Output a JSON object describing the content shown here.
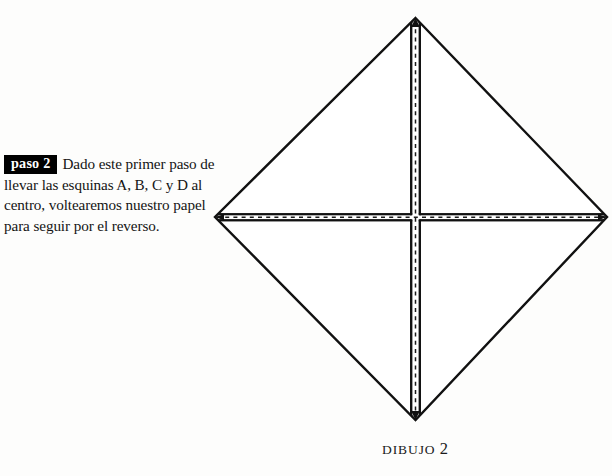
{
  "page": {
    "background_color": "#fdfdfc",
    "ink_color": "#141414"
  },
  "instruction": {
    "badge_label": "paso 2",
    "badge_background": "#000000",
    "badge_text_color": "#ffffff",
    "body_text": "Dado este primer paso de llevar las esquinas A, B, C y D al centro, voltearemos nuestro papel para seguir por el reverso."
  },
  "figure": {
    "caption_word": "DIBUJO",
    "caption_number": "2",
    "stroke_color": "#111111",
    "diamond": {
      "top": [
        415,
        18
      ],
      "left": [
        215,
        217
      ],
      "right": [
        607,
        217
      ],
      "bottom": [
        415,
        420
      ]
    },
    "fold_lines": {
      "vertical_dashed": {
        "x": 415,
        "y1": 20,
        "y2": 418
      },
      "horizontal_dashed": {
        "y": 217,
        "x1": 217,
        "x2": 605
      }
    }
  },
  "caption": {
    "text": "DIBUJO 2"
  }
}
